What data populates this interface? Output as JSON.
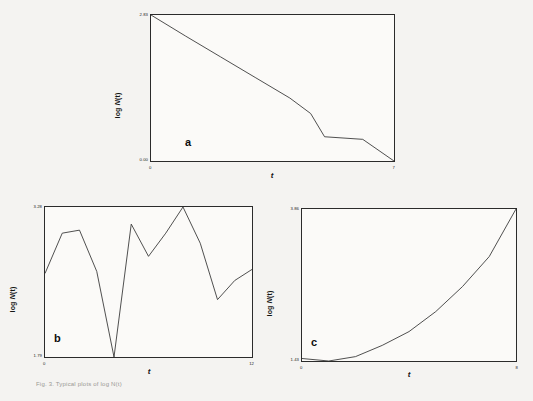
{
  "figure": {
    "caption": "Fig. 3. Typical plots of log N(t)",
    "line_color": "#3a3a3a",
    "frame_color": "#2b2b2b",
    "background": "#f4f3f1"
  },
  "panels": [
    {
      "letter": "a",
      "ylabel_prefix": "log ",
      "ylabel_var": "N",
      "ylabel_suffix": "(t)",
      "xlabel": "t",
      "y_top": "2.83",
      "y_bottom": "0.00",
      "x_left": "0",
      "x_right": "7"
    },
    {
      "letter": "b",
      "ylabel_prefix": "log ",
      "ylabel_var": "N",
      "ylabel_suffix": "(t)",
      "xlabel": "t",
      "y_top": "3.28",
      "y_bottom": "1.79",
      "x_left": "0",
      "x_right": "12"
    },
    {
      "letter": "c",
      "ylabel_prefix": "log ",
      "ylabel_var": "N",
      "ylabel_suffix": "(t)",
      "xlabel": "t",
      "y_top": "3.86",
      "y_bottom": "1.43",
      "x_left": "0",
      "x_right": "8"
    }
  ],
  "chart_data": [
    {
      "type": "line",
      "panel": "a",
      "title": "",
      "xlabel": "t",
      "ylabel": "log N(t)",
      "xlim": [
        0,
        7
      ],
      "ylim": [
        0.0,
        2.83
      ],
      "grid": false,
      "legend": null,
      "x": [
        0,
        1,
        2,
        3,
        4,
        4.6,
        5.0,
        6.1,
        7
      ],
      "values": [
        2.83,
        2.42,
        2.02,
        1.62,
        1.22,
        0.92,
        0.47,
        0.42,
        0.0
      ]
    },
    {
      "type": "line",
      "panel": "b",
      "title": "",
      "xlabel": "t",
      "ylabel": "log N(t)",
      "xlim": [
        0,
        12
      ],
      "ylim": [
        1.79,
        3.28
      ],
      "grid": false,
      "legend": null,
      "x": [
        0,
        1,
        2,
        3,
        4,
        5,
        6,
        7,
        8,
        9,
        10,
        11,
        12
      ],
      "values": [
        2.62,
        3.02,
        3.05,
        2.64,
        1.79,
        3.11,
        2.79,
        3.02,
        3.28,
        2.92,
        2.36,
        2.55,
        2.66
      ]
    },
    {
      "type": "line",
      "panel": "c",
      "title": "",
      "xlabel": "t",
      "ylabel": "log N(t)",
      "xlim": [
        0,
        8
      ],
      "ylim": [
        1.43,
        3.86
      ],
      "grid": false,
      "legend": null,
      "x": [
        0,
        1,
        2,
        3,
        4,
        5,
        6,
        7,
        8
      ],
      "values": [
        1.47,
        1.43,
        1.5,
        1.68,
        1.9,
        2.22,
        2.62,
        3.1,
        3.86
      ]
    }
  ]
}
